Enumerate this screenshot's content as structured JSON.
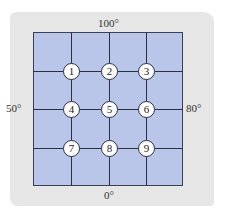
{
  "diagram": {
    "boundaries": {
      "top": "100°",
      "left": "50°",
      "right": "80°",
      "bottom": "0°"
    },
    "nodes": [
      "1",
      "2",
      "3",
      "4",
      "5",
      "6",
      "7",
      "8",
      "9"
    ],
    "colors": {
      "plate": "#b9c6ea",
      "background": "#e6e6e6",
      "lines": "#2b2f40"
    }
  }
}
